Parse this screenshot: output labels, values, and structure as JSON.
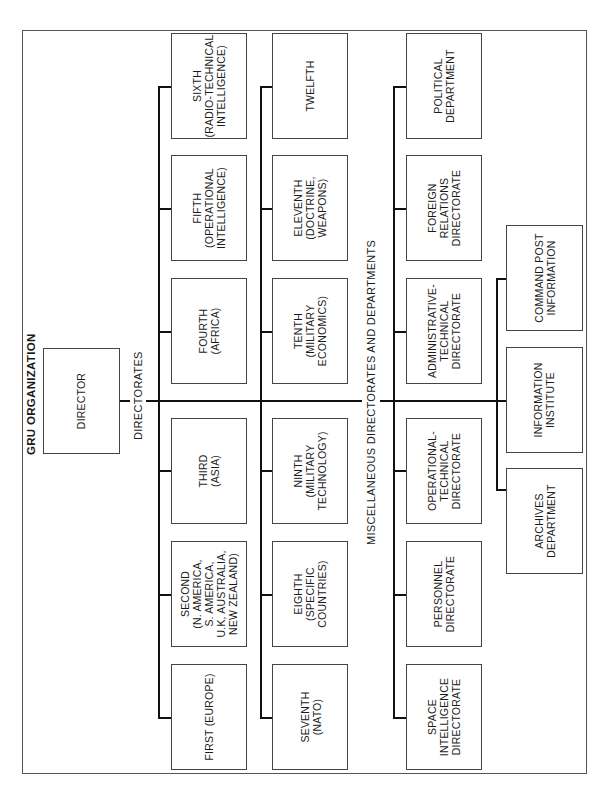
{
  "title": "GRU ORGANIZATION",
  "director": {
    "label": "DIRECTOR"
  },
  "sections": {
    "directorates": "DIRECTORATES",
    "misc": "MISCELLANEOUS DIRECTORATES AND DEPARTMENTS"
  },
  "directorates_row1": [
    {
      "label": "FIRST (EUROPE)"
    },
    {
      "label": "SECOND\n(N. AMERICA,\nS. AMERICA,\nU.K, AUSTRALIA,\nNEW ZEALAND)"
    },
    {
      "label": "THIRD\n(ASIA)"
    },
    {
      "label": "FOURTH\n(AFRICA)"
    },
    {
      "label": "FIFTH\n(OPERATIONAL\nINTELLIGENCE)"
    },
    {
      "label": "SIXTH\n(RADIO-TECHNICAL\nINTELLIGENCE)"
    }
  ],
  "directorates_row2": [
    {
      "label": "SEVENTH\n(NATO)"
    },
    {
      "label": "EIGHTH\n(SPECIFIC\nCOUNTRIES)"
    },
    {
      "label": "NINTH\n(MILITARY\nTECHNOLOGY)"
    },
    {
      "label": "TENTH\n(MILITARY\nECONOMICS)"
    },
    {
      "label": "ELEVENTH\n(DOCTRINE,\nWEAPONS)"
    },
    {
      "label": "TWELFTH"
    }
  ],
  "misc_row1": [
    {
      "label": "SPACE\nINTELLIGENCE\nDIRECTORATE"
    },
    {
      "label": "PERSONNEL\nDIRECTORATE"
    },
    {
      "label": "OPERATIONAL-\nTECHNICAL\nDIRECTORATE"
    },
    {
      "label": "ADMINISTRATIVE-\nTECHNICAL\nDIRECTORATE"
    },
    {
      "label": "FOREIGN\nRELATIONS\nDIRECTORATE"
    },
    {
      "label": "POLITICAL\nDEPARTMENT"
    }
  ],
  "misc_row2": [
    {
      "label": "ARCHIVES\nDEPARTMENT"
    },
    {
      "label": "INFORMATION\nINSTITUTE"
    },
    {
      "label": "COMMAND POST\nINFORMATION"
    }
  ]
}
